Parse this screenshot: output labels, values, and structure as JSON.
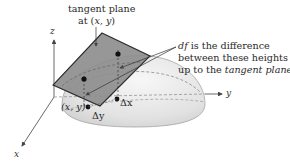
{
  "figure": {
    "title_label_line1": "tangent plane",
    "title_label_line2_prefix": "at (",
    "title_label_line2_vars": "x, y",
    "title_label_line2_suffix": ")",
    "annotation": {
      "line1_italic": "df",
      "line1_rest": " is the difference",
      "line2": "between these heights",
      "line3_prefix": "up to the ",
      "line3_italic": "tangent plane"
    },
    "axes": {
      "x": "x",
      "y": "y",
      "z": "z"
    },
    "point_label": "(x, y)",
    "delta_x": "Δx",
    "delta_y": "Δy"
  },
  "colors": {
    "plane_fill": "#8c8c8c",
    "plane_edge": "#2b2b2b",
    "dome_fill": "#e6e6e6",
    "dome_edge": "#9a9a9a",
    "axis": "#444444",
    "text": "#2a2a2a"
  }
}
